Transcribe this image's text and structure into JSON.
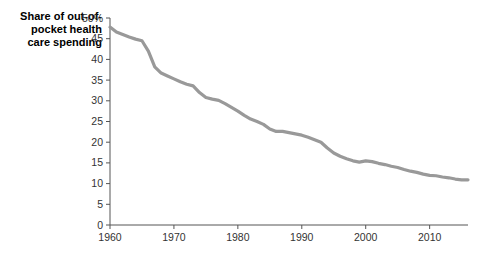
{
  "chart_data": {
    "type": "line",
    "title": "",
    "ylabel": "Share of out-of-pocket health care spending",
    "xlabel": "",
    "xlim": [
      1960,
      2016
    ],
    "ylim": [
      0,
      50
    ],
    "grid": false,
    "legend": null,
    "line_color": "#999999",
    "axis_color": "#555555",
    "y_ticks": [
      "0",
      "5",
      "10",
      "15",
      "20",
      "25",
      "30",
      "35",
      "40",
      "45",
      "50%"
    ],
    "y_tick_values": [
      0,
      5,
      10,
      15,
      20,
      25,
      30,
      35,
      40,
      45,
      50
    ],
    "x_ticks": [
      "1960",
      "1970",
      "1980",
      "1990",
      "2000",
      "2010"
    ],
    "x_tick_values": [
      1960,
      1970,
      1980,
      1990,
      2000,
      2010
    ],
    "x": [
      1960,
      1961,
      1962,
      1963,
      1964,
      1965,
      1966,
      1967,
      1968,
      1969,
      1970,
      1971,
      1972,
      1973,
      1974,
      1975,
      1976,
      1977,
      1978,
      1979,
      1980,
      1981,
      1982,
      1983,
      1984,
      1985,
      1986,
      1987,
      1988,
      1989,
      1990,
      1991,
      1992,
      1993,
      1994,
      1995,
      1996,
      1997,
      1998,
      1999,
      2000,
      2001,
      2002,
      2003,
      2004,
      2005,
      2006,
      2007,
      2008,
      2009,
      2010,
      2011,
      2012,
      2013,
      2014,
      2015,
      2016
    ],
    "values": [
      47.8,
      46.6,
      46.0,
      45.4,
      44.9,
      44.5,
      42.0,
      38.2,
      36.7,
      36.0,
      35.3,
      34.6,
      34.0,
      33.6,
      32.0,
      30.8,
      30.4,
      30.1,
      29.3,
      28.4,
      27.5,
      26.5,
      25.6,
      25.0,
      24.3,
      23.2,
      22.6,
      22.6,
      22.3,
      22.0,
      21.7,
      21.2,
      20.6,
      20.0,
      18.6,
      17.4,
      16.6,
      16.0,
      15.5,
      15.2,
      15.5,
      15.3,
      14.9,
      14.6,
      14.2,
      13.9,
      13.4,
      13.0,
      12.7,
      12.3,
      12.0,
      11.9,
      11.6,
      11.4,
      11.1,
      10.9,
      10.9
    ]
  },
  "axis": {
    "y_title_line1": "Share of out-of-",
    "y_title_line2": "pocket health",
    "y_title_line3": "care spending"
  }
}
